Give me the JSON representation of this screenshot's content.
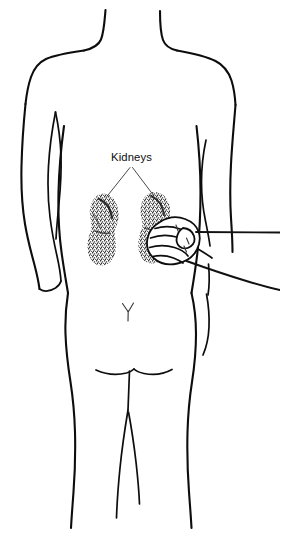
{
  "illustration": {
    "title": "Kidney percussion examination - posterior torso view",
    "view": "posterior",
    "line_color": "#0d0d0d",
    "background_color": "#ffffff",
    "stipple_color": "#1a1a1a"
  },
  "labels": {
    "kidneys": {
      "text": "Kidneys",
      "x": 111,
      "y": 161
    }
  },
  "anatomy": {
    "kidney_left": {
      "name": "left-kidney",
      "center_x": 104,
      "center_y": 228
    },
    "kidney_right": {
      "name": "right-kidney",
      "center_x": 155,
      "center_y": 226
    },
    "sacral_mark": {
      "name": "sacral-y-mark",
      "x": 126,
      "y": 310
    }
  },
  "examiner": {
    "fist": {
      "name": "examiner-fist",
      "center_x": 178,
      "center_y": 240
    },
    "forearm": {
      "name": "examiner-forearm"
    }
  }
}
